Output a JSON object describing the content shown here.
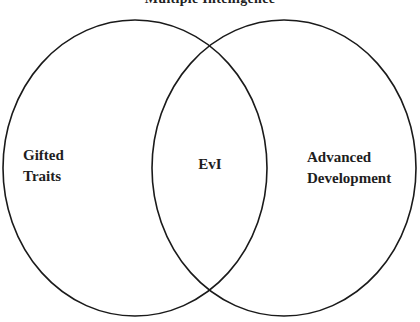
{
  "diagram": {
    "type": "venn",
    "title": "Multiple Intelligence",
    "stroke_color": "#1a1a1a",
    "background": "#ffffff",
    "sets": [
      {
        "id": "left",
        "label_lines": [
          "Gifted",
          "Traits"
        ]
      },
      {
        "id": "right",
        "label_lines": [
          "Advanced",
          "Development"
        ]
      }
    ],
    "intersection": {
      "label": "EvI"
    }
  }
}
